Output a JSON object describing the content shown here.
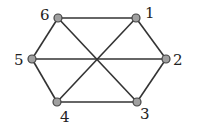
{
  "graph": {
    "nodes": [
      {
        "id": "1",
        "label": "1",
        "x": 136,
        "y": 18,
        "lx": 145,
        "ly": 18
      },
      {
        "id": "2",
        "label": "2",
        "x": 166,
        "y": 59,
        "lx": 173,
        "ly": 65
      },
      {
        "id": "3",
        "label": "3",
        "x": 137,
        "y": 102,
        "lx": 140,
        "ly": 119
      },
      {
        "id": "4",
        "label": "4",
        "x": 57,
        "y": 102,
        "lx": 60,
        "ly": 122
      },
      {
        "id": "5",
        "label": "5",
        "x": 32,
        "y": 59,
        "lx": 14,
        "ly": 65
      },
      {
        "id": "6",
        "label": "6",
        "x": 58,
        "y": 18,
        "lx": 40,
        "ly": 20
      }
    ],
    "edges": [
      [
        "6",
        "1"
      ],
      [
        "1",
        "2"
      ],
      [
        "2",
        "3"
      ],
      [
        "3",
        "4"
      ],
      [
        "4",
        "5"
      ],
      [
        "5",
        "6"
      ],
      [
        "6",
        "3"
      ],
      [
        "1",
        "4"
      ],
      [
        "5",
        "2"
      ]
    ]
  }
}
